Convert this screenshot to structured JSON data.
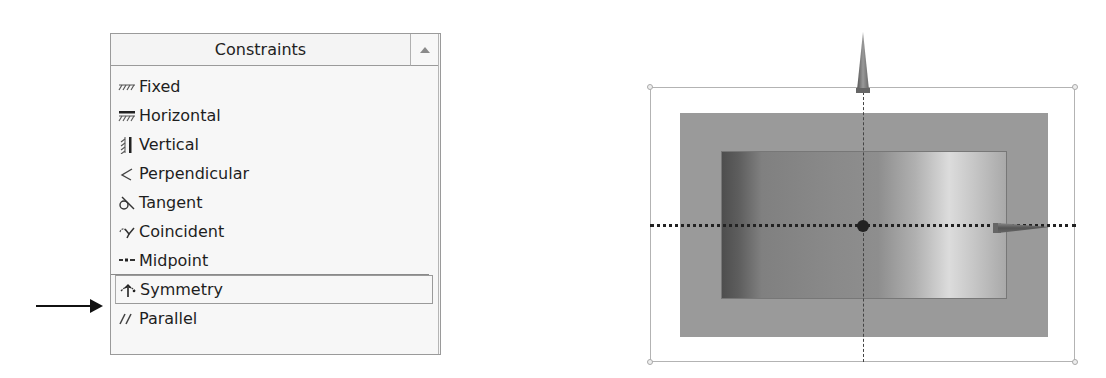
{
  "panel": {
    "title": "Constraints",
    "scroll_up_icon": "triangle-up",
    "items": [
      {
        "label": "Fixed",
        "icon": "fixed-icon",
        "selected": false
      },
      {
        "label": "Horizontal",
        "icon": "horizontal-icon",
        "selected": false
      },
      {
        "label": "Vertical",
        "icon": "vertical-icon",
        "selected": false
      },
      {
        "label": "Perpendicular",
        "icon": "perpendicular-icon",
        "selected": false
      },
      {
        "label": "Tangent",
        "icon": "tangent-icon",
        "selected": false
      },
      {
        "label": "Coincident",
        "icon": "coincident-icon",
        "selected": false
      },
      {
        "label": "Midpoint",
        "icon": "midpoint-icon",
        "selected": false
      },
      {
        "label": "Symmetry",
        "icon": "symmetry-icon",
        "selected": true
      },
      {
        "label": "Parallel",
        "icon": "parallel-icon",
        "selected": false
      }
    ]
  },
  "annotation": {
    "pointer_target": "Symmetry"
  },
  "viewport": {
    "description": "Rectangle with symmetric constraint about vertical and horizontal axes",
    "colors": {
      "outer_rect": "#9a9a9a",
      "inner_gradient_dark": "#4e4e4e",
      "inner_gradient_light": "#dcdcdc",
      "axis": "#222222"
    }
  }
}
